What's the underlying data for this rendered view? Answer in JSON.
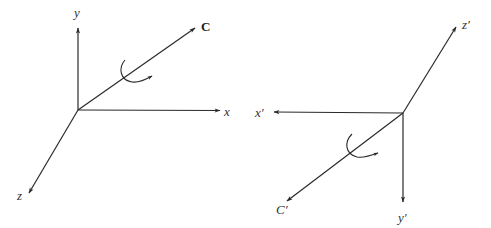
{
  "figure": {
    "left": {
      "name": "original-frame",
      "origin": [
        78,
        110
      ],
      "axes": [
        {
          "id": "y",
          "label": "y",
          "tip": [
            78,
            27
          ],
          "label_pos": [
            76,
            17
          ]
        },
        {
          "id": "x",
          "label": "x",
          "tip": [
            221,
            111
          ],
          "label_pos": [
            225,
            116
          ]
        },
        {
          "id": "z",
          "label": "z",
          "tip": [
            28,
            194
          ],
          "label_pos": [
            17,
            200
          ]
        },
        {
          "id": "C",
          "label": "C",
          "tip": [
            196,
            27
          ],
          "label_pos": [
            202,
            31
          ],
          "bold": true
        }
      ],
      "rotation_arrow": {
        "about": "C",
        "center": [
          128,
          76
        ]
      }
    },
    "right": {
      "name": "rotated-frame",
      "origin": [
        403,
        113
      ],
      "axes": [
        {
          "id": "z-prime",
          "label": "z′",
          "tip": [
            457,
            26
          ],
          "label_pos": [
            462,
            29
          ]
        },
        {
          "id": "x-prime",
          "label": "x′",
          "tip": [
            273,
            112
          ],
          "label_pos": [
            255,
            117
          ]
        },
        {
          "id": "y-prime",
          "label": "y′",
          "tip": [
            403,
            203
          ],
          "label_pos": [
            398,
            222
          ]
        },
        {
          "id": "C-prime",
          "label": "C′",
          "tip": [
            286,
            202
          ],
          "label_pos": [
            276,
            214
          ]
        }
      ],
      "rotation_arrow": {
        "about": "C′",
        "center": [
          354,
          151
        ]
      }
    }
  },
  "colors": {
    "line": "#2a2a2a",
    "text": "#333333",
    "background": "#ffffff"
  }
}
